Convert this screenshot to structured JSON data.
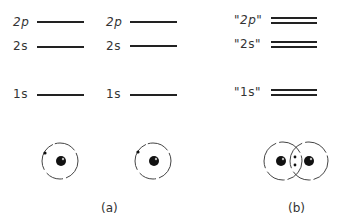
{
  "diagram": {
    "panel_a": {
      "caption": "(a)",
      "atom_left": {
        "levels": [
          {
            "label": "2p",
            "y": 22
          },
          {
            "label": "2s",
            "y": 46
          },
          {
            "label": "1s",
            "y": 94
          }
        ]
      },
      "atom_right": {
        "levels": [
          {
            "label": "2p",
            "y": 22
          },
          {
            "label": "2s",
            "y": 46
          },
          {
            "label": "1s",
            "y": 94
          }
        ]
      }
    },
    "panel_b": {
      "caption": "(b)",
      "levels": [
        {
          "label": "\"2p\"",
          "y": 20
        },
        {
          "label": "\"2s\"",
          "y": 44
        },
        {
          "label": "\"1s\"",
          "y": 92
        }
      ]
    }
  }
}
